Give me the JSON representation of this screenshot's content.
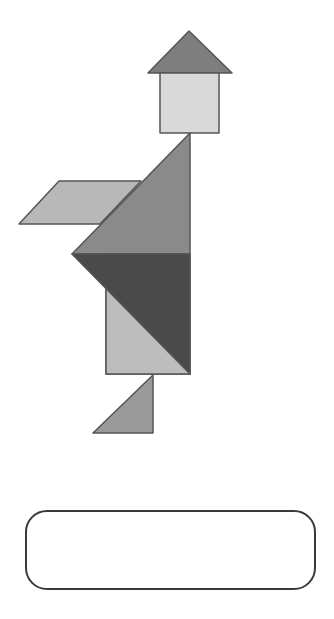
{
  "figure": {
    "title": "",
    "colors": {
      "roof": "#7e7e7e",
      "square": "#d9d9d9",
      "parallelogram": "#b8b8b8",
      "large_triangle_top": "#8a8a8a",
      "large_triangle_dark": "#4a4a4a",
      "medium_triangle_light": "#bdbdbd",
      "small_triangle_foot": "#9a9a9a",
      "outline": "#555555"
    },
    "pieces": [
      {
        "name": "roof-triangle",
        "points": "189,31 148,73 232,73",
        "color_key": "roof"
      },
      {
        "name": "square",
        "points": "160,73 219,73 219,133 160,133",
        "color_key": "square"
      },
      {
        "name": "parallelogram",
        "points": "59,181 141,181 100,224 19,224",
        "color_key": "parallelogram"
      },
      {
        "name": "large-triangle-top",
        "points": "190,133 72,254 190,254",
        "color_key": "large_triangle_top"
      },
      {
        "name": "body-rectangle-light",
        "points": "106,288 106,374 190,374",
        "color_key": "medium_triangle_light"
      },
      {
        "name": "body-rectangle-back",
        "points": "106,254 190,254 190,374 106,374",
        "color_key": "medium_triangle_light"
      },
      {
        "name": "large-triangle-dark",
        "points": "72,254 190,254 190,374",
        "color_key": "large_triangle_dark"
      },
      {
        "name": "small-triangle-foot",
        "points": "153,375 93,433 153,433",
        "color_key": "small_triangle_foot"
      }
    ]
  },
  "answer_box": {
    "value": ""
  }
}
